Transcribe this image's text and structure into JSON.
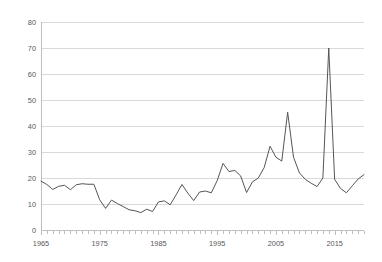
{
  "chart_data": {
    "type": "line",
    "title": "",
    "subtitle": "",
    "xlabel": "",
    "ylabel": "",
    "xlim": [
      1965,
      2020
    ],
    "ylim": [
      0,
      80
    ],
    "grid": true,
    "legend": false,
    "legend_position": "none",
    "y_ticks": [
      0,
      10,
      20,
      30,
      40,
      50,
      60,
      70,
      80
    ],
    "y_tick_labels": [
      "0",
      "10",
      "20",
      "30",
      "40",
      "50",
      "60",
      "70",
      "80"
    ],
    "x_ticks": [
      1965,
      1975,
      1985,
      1995,
      2005,
      2015
    ],
    "x_tick_labels": [
      "1965",
      "1975",
      "1985",
      "1995",
      "2005",
      "2015"
    ],
    "x_minor_tick_step": 1,
    "line_color": "#555555",
    "gridline_color": "#d9d9d9",
    "axis_color": "#bfbfbf",
    "tick_label_color": "#595959",
    "series": [
      {
        "name": "series-1",
        "x": [
          1965,
          1966,
          1967,
          1968,
          1969,
          1970,
          1971,
          1972,
          1973,
          1974,
          1975,
          1976,
          1977,
          1978,
          1979,
          1980,
          1981,
          1982,
          1983,
          1984,
          1985,
          1986,
          1987,
          1988,
          1989,
          1990,
          1991,
          1992,
          1993,
          1994,
          1995,
          1996,
          1997,
          1998,
          1999,
          2000,
          2001,
          2002,
          2003,
          2004,
          2005,
          2006,
          2007,
          2008,
          2009,
          2010,
          2011,
          2012,
          2013,
          2014,
          2015,
          2016,
          2017,
          2018,
          2019,
          2020
        ],
        "values": [
          18.8,
          17.5,
          15.6,
          16.8,
          17.2,
          15.5,
          17.4,
          17.8,
          17.6,
          17.6,
          11.6,
          8.3,
          11.5,
          10.2,
          9.0,
          7.8,
          7.4,
          6.7,
          8.0,
          7.1,
          10.8,
          11.2,
          9.7,
          13.5,
          17.5,
          14.2,
          11.3,
          14.6,
          15.0,
          14.3,
          19.0,
          25.6,
          22.5,
          22.9,
          20.8,
          14.4,
          18.5,
          20.0,
          24.0,
          32.2,
          28.0,
          26.5,
          45.3,
          28.0,
          22.0,
          19.5,
          18.0,
          16.7,
          20.0,
          70.0,
          19.5,
          16.0,
          14.3,
          17.0,
          19.6,
          21.3
        ]
      }
    ],
    "annotations": []
  },
  "chart_extra": {
    "tail_x": [
      2016,
      2017,
      2018,
      2019,
      2020
    ],
    "tail_values": [
      16.0,
      14.3,
      17.0,
      19.6,
      21.3
    ],
    "peak_labels": {
      "peak_2008": "70",
      "peak_2003": "45",
      "peak_1999": "32"
    }
  }
}
